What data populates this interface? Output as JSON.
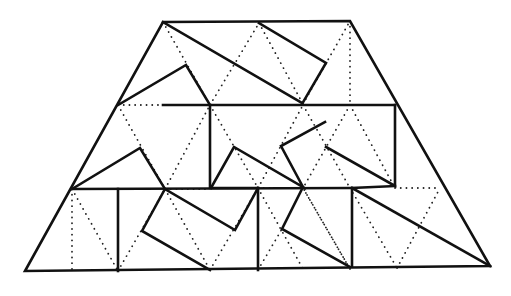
{
  "diagram": {
    "colors": {
      "background": "#ffffff",
      "line": "#111111",
      "grid": "#222222"
    },
    "outline": [
      [
        163,
        22
      ],
      [
        350,
        21
      ],
      [
        490,
        266
      ],
      [
        25,
        271
      ]
    ],
    "row_lines": [
      {
        "x1": 163,
        "y1": 105,
        "x2": 395,
        "y2": 105
      },
      {
        "x1": 72,
        "y1": 189,
        "x2": 352,
        "y2": 188
      }
    ],
    "solid_polylines": [
      [
        [
          163,
          22
        ],
        [
          302,
          103
        ]
      ],
      [
        [
          259,
          23
        ],
        [
          326,
          63
        ],
        [
          302,
          104
        ]
      ],
      [
        [
          118,
          105
        ],
        [
          186,
          65
        ],
        [
          210,
          105
        ]
      ],
      [
        [
          210,
          105
        ],
        [
          210,
          188
        ],
        [
          258,
          188
        ]
      ],
      [
        [
          72,
          189
        ],
        [
          140,
          148
        ],
        [
          165,
          189
        ]
      ],
      [
        [
          118,
          189
        ],
        [
          118,
          271
        ]
      ],
      [
        [
          165,
          189
        ],
        [
          142,
          231
        ],
        [
          210,
          270
        ]
      ],
      [
        [
          165,
          189
        ],
        [
          235,
          230
        ],
        [
          258,
          188
        ]
      ],
      [
        [
          258,
          188
        ],
        [
          258,
          270
        ]
      ],
      [
        [
          211,
          188
        ],
        [
          234,
          147
        ],
        [
          303,
          187
        ],
        [
          281,
          146
        ],
        [
          325,
          122
        ]
      ],
      [
        [
          303,
          187
        ],
        [
          282,
          229
        ],
        [
          350,
          267
        ]
      ],
      [
        [
          326,
          147
        ],
        [
          395,
          186
        ],
        [
          395,
          105
        ]
      ],
      [
        [
          395,
          186
        ],
        [
          352,
          188
        ],
        [
          352,
          266
        ]
      ],
      [
        [
          352,
          188
        ],
        [
          490,
          266
        ]
      ]
    ],
    "dotted_lines": [
      [
        [
          118,
          105
        ],
        [
          163,
          105
        ]
      ],
      [
        [
          163,
          22
        ],
        [
          210,
          105
        ]
      ],
      [
        [
          210,
          105
        ],
        [
          259,
          23
        ]
      ],
      [
        [
          259,
          23
        ],
        [
          303,
          104
        ]
      ],
      [
        [
          303,
          104
        ],
        [
          350,
          21
        ]
      ],
      [
        [
          350,
          21
        ],
        [
          350,
          105
        ]
      ],
      [
        [
          118,
          105
        ],
        [
          165,
          189
        ]
      ],
      [
        [
          165,
          189
        ],
        [
          210,
          105
        ]
      ],
      [
        [
          210,
          105
        ],
        [
          258,
          188
        ]
      ],
      [
        [
          258,
          188
        ],
        [
          303,
          105
        ]
      ],
      [
        [
          303,
          105
        ],
        [
          350,
          188
        ]
      ],
      [
        [
          350,
          105
        ],
        [
          395,
          188
        ]
      ],
      [
        [
          350,
          105
        ],
        [
          303,
          188
        ]
      ],
      [
        [
          72,
          189
        ],
        [
          118,
          189
        ]
      ],
      [
        [
          165,
          189
        ],
        [
          210,
          189
        ]
      ],
      [
        [
          258,
          188
        ],
        [
          303,
          188
        ]
      ],
      [
        [
          395,
          188
        ],
        [
          440,
          188
        ]
      ],
      [
        [
          72,
          189
        ],
        [
          72,
          271
        ]
      ],
      [
        [
          72,
          189
        ],
        [
          118,
          271
        ]
      ],
      [
        [
          118,
          271
        ],
        [
          165,
          189
        ]
      ],
      [
        [
          165,
          189
        ],
        [
          210,
          270
        ]
      ],
      [
        [
          210,
          270
        ],
        [
          258,
          188
        ]
      ],
      [
        [
          258,
          188
        ],
        [
          303,
          269
        ]
      ],
      [
        [
          303,
          188
        ],
        [
          350,
          269
        ]
      ],
      [
        [
          350,
          188
        ],
        [
          397,
          268
        ]
      ],
      [
        [
          397,
          268
        ],
        [
          440,
          188
        ]
      ],
      [
        [
          258,
          270
        ],
        [
          282,
          229
        ]
      ],
      [
        [
          350,
          269
        ],
        [
          303,
          188
        ]
      ]
    ]
  }
}
